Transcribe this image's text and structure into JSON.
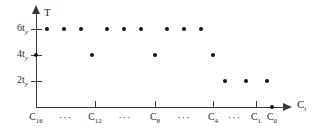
{
  "figure": {
    "background_color": "#ffffff",
    "axis_color": "#3a3a3a",
    "marker_color": "#141414"
  },
  "axes": {
    "y_title": "T",
    "x_title_base": "C",
    "x_title_sub": "i",
    "y_ticks": [
      {
        "label_base": "6t",
        "label_sub": "y",
        "value": 6
      },
      {
        "label_base": "4t",
        "label_sub": "y",
        "value": 4
      },
      {
        "label_base": "2t",
        "label_sub": "y",
        "value": 2
      }
    ],
    "x_ticks": [
      {
        "label_base": "C",
        "label_sub": "16"
      },
      {
        "label_base": "C",
        "label_sub": "12"
      },
      {
        "label_base": "C",
        "label_sub": "8"
      },
      {
        "label_base": "C",
        "label_sub": "4"
      },
      {
        "label_base": "C",
        "label_sub": "1"
      },
      {
        "label_base": "C",
        "label_sub": "0"
      }
    ],
    "ellipses": [
      "···",
      "···",
      "···",
      "···"
    ]
  },
  "chart_data": {
    "type": "scatter",
    "title": "",
    "xlabel": "C_i",
    "ylabel": "T",
    "grid": false,
    "legend": false,
    "ytick_labels": [
      "2t_y",
      "4t_y",
      "6t_y"
    ],
    "ytick_values": [
      2,
      4,
      6
    ],
    "ylim": [
      0,
      7
    ],
    "xtick_labels": [
      "C_16",
      "C_12",
      "C_8",
      "C_4",
      "C_1",
      "C_0"
    ],
    "xtick_pixels": [
      36,
      95,
      155,
      213,
      256,
      272
    ],
    "points": [
      {
        "x_px": 47,
        "y": 6
      },
      {
        "x_px": 64,
        "y": 6
      },
      {
        "x_px": 81,
        "y": 6
      },
      {
        "x_px": 107,
        "y": 6
      },
      {
        "x_px": 124,
        "y": 6
      },
      {
        "x_px": 141,
        "y": 6
      },
      {
        "x_px": 167,
        "y": 6
      },
      {
        "x_px": 184,
        "y": 6
      },
      {
        "x_px": 201,
        "y": 6
      },
      {
        "x_px": 36,
        "y": 4
      },
      {
        "x_px": 92,
        "y": 4
      },
      {
        "x_px": 155,
        "y": 4
      },
      {
        "x_px": 213,
        "y": 4
      },
      {
        "x_px": 225,
        "y": 2
      },
      {
        "x_px": 246,
        "y": 2
      },
      {
        "x_px": 267,
        "y": 2
      },
      {
        "x_px": 272,
        "y": 0
      }
    ]
  }
}
